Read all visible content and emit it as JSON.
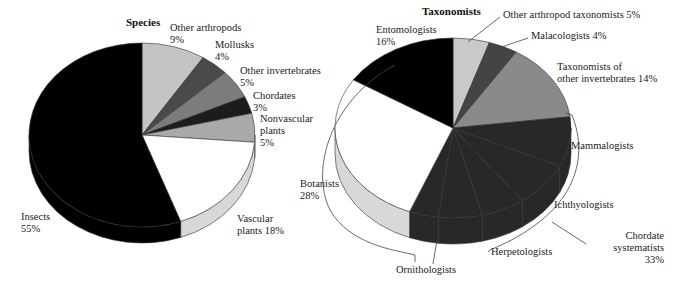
{
  "chart_data": [
    {
      "type": "pie",
      "title": "Species",
      "categories": [
        "Other arthropods",
        "Mollusks",
        "Other invertebrates",
        "Chordates",
        "Nonvascular plants",
        "Vascular plants",
        "Insects"
      ],
      "values": [
        9,
        4,
        5,
        3,
        5,
        18,
        55
      ],
      "unit": "%",
      "colors": [
        "#c4c4c4",
        "#4a4a4a",
        "#7c7c7c",
        "#1c1c1c",
        "#a9a9a9",
        "#ffffff",
        "#000000"
      ],
      "labels": [
        {
          "lines": [
            "Other arthropods",
            "9%"
          ]
        },
        {
          "lines": [
            "Mollusks",
            "4%"
          ]
        },
        {
          "lines": [
            "Other invertebrates",
            "5%"
          ]
        },
        {
          "lines": [
            "Chordates",
            "3%"
          ]
        },
        {
          "lines": [
            "Nonvascular",
            "plants",
            "5%"
          ]
        },
        {
          "lines": [
            "Vascular",
            "plants 18%"
          ]
        },
        {
          "lines": [
            "Insects",
            "55%"
          ]
        }
      ]
    },
    {
      "type": "pie",
      "title": "Taxonomists",
      "categories": [
        "Other arthropod taxonomists",
        "Malacologists",
        "Taxonomists of other invertebrates",
        "Mammalogists",
        "Ichthyologists",
        "Chordate (other)",
        "Herpetologists",
        "Ornithologists",
        "Botanists",
        "Entomologists"
      ],
      "values": [
        5,
        4,
        14,
        9,
        8,
        6,
        6,
        4,
        28,
        16
      ],
      "unit": "%",
      "group": {
        "name": "Chordate systematists",
        "value": 33,
        "members": [
          "Mammalogists",
          "Ichthyologists",
          "Chordate (other)",
          "Herpetologists",
          "Ornithologists"
        ]
      },
      "colors": [
        "#c9c9c9",
        "#444444",
        "#8a8a8a",
        "#2a2728",
        "#2a2728",
        "#2a2728",
        "#2a2728",
        "#2a2728",
        "#ffffff",
        "#000000"
      ],
      "labels": [
        {
          "lines": [
            "Other arthropod taxonomists 5%"
          ]
        },
        {
          "lines": [
            "Malacologists 4%"
          ]
        },
        {
          "lines": [
            "Taxonomists of",
            "other invertebrates 14%"
          ]
        },
        {
          "lines": [
            "Mammalogists"
          ]
        },
        {
          "lines": [
            "Ichthyologists"
          ]
        },
        {
          "lines": [
            "Chordate",
            "systematists",
            "33%"
          ]
        },
        {
          "lines": [
            "Herpetologists"
          ]
        },
        {
          "lines": [
            "Ornithologists"
          ]
        },
        {
          "lines": [
            "Botanists",
            "28%"
          ]
        },
        {
          "lines": [
            "Entomologists",
            "16%"
          ]
        }
      ]
    }
  ]
}
